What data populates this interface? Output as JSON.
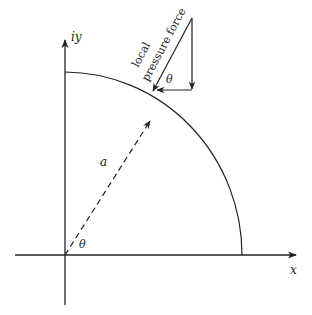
{
  "diagram": {
    "axes": {
      "x_label": "x",
      "y_label": "iy"
    },
    "labels": {
      "radius": "a",
      "angle_origin": "θ",
      "angle_force": "θ",
      "force_line1": "local",
      "force_line2": "pressure force"
    },
    "colors": {
      "stroke": "#222222",
      "background": "#ffffff"
    }
  }
}
